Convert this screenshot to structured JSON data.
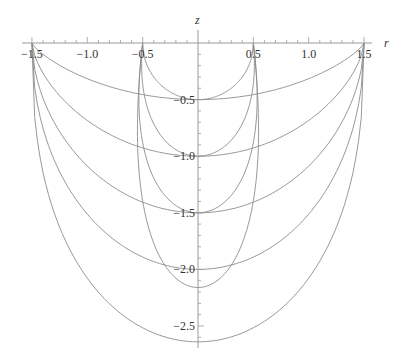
{
  "chart_data": {
    "type": "line",
    "title": "",
    "xlabel": "r",
    "ylabel": "z",
    "xlim": [
      -1.5,
      1.5
    ],
    "ylim": [
      -2.65,
      0
    ],
    "grid": false,
    "legend": null,
    "x_ticks": [
      {
        "value": -1.5,
        "label": "−1.5"
      },
      {
        "value": -1.0,
        "label": "−1.0"
      },
      {
        "value": -0.5,
        "label": "−0.5"
      },
      {
        "value": 0.5,
        "label": "0.5"
      },
      {
        "value": 1.0,
        "label": "1.0"
      },
      {
        "value": 1.5,
        "label": "1.5"
      }
    ],
    "y_ticks": [
      {
        "value": -0.5,
        "label": "−0.5"
      },
      {
        "value": -1.0,
        "label": "−1.0"
      },
      {
        "value": -1.5,
        "label": "−1.5"
      },
      {
        "value": -2.0,
        "label": "−2.0"
      },
      {
        "value": -2.5,
        "label": "−2.5"
      }
    ],
    "series": [
      {
        "name": "outer-1",
        "family": "outer",
        "rim_r": 1.5,
        "bottom_z": -0.5,
        "bulge_r": 1.5
      },
      {
        "name": "outer-2",
        "family": "outer",
        "rim_r": 1.5,
        "bottom_z": -1.0,
        "bulge_r": 1.5
      },
      {
        "name": "outer-3",
        "family": "outer",
        "rim_r": 1.5,
        "bottom_z": -1.5,
        "bulge_r": 1.5
      },
      {
        "name": "outer-4",
        "family": "outer",
        "rim_r": 1.5,
        "bottom_z": -2.0,
        "bulge_r": 1.5
      },
      {
        "name": "outer-5",
        "family": "outer",
        "rim_r": 1.5,
        "bottom_z": -2.64,
        "bulge_r": 1.5
      },
      {
        "name": "inner-1",
        "family": "inner",
        "rim_r": 0.5,
        "bottom_z": -0.5,
        "bulge_r": 0.5
      },
      {
        "name": "inner-2",
        "family": "inner",
        "rim_r": 0.5,
        "bottom_z": -1.0,
        "bulge_r": 0.55
      },
      {
        "name": "inner-3",
        "family": "inner",
        "rim_r": 0.5,
        "bottom_z": -1.5,
        "bulge_r": 0.6
      },
      {
        "name": "inner-4",
        "family": "inner",
        "rim_r": 0.5,
        "bottom_z": -2.16,
        "bulge_r": 0.62
      }
    ]
  }
}
